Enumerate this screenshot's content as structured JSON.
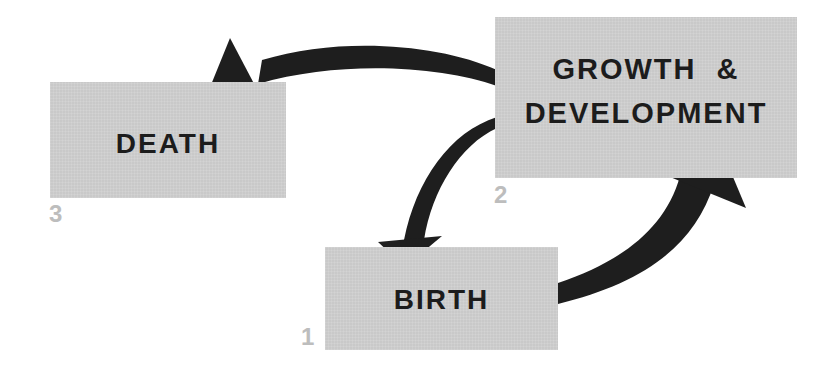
{
  "diagram": {
    "type": "life-cycle",
    "nodes": [
      {
        "id": "death",
        "label": "DEATH",
        "number": "3"
      },
      {
        "id": "growth",
        "label_line1": "GROWTH  &",
        "label_line2": "DEVELOPMENT",
        "number": "2"
      },
      {
        "id": "birth",
        "label": "BIRTH",
        "number": "1"
      }
    ],
    "edges": [
      {
        "from": "birth",
        "to": "growth"
      },
      {
        "from": "growth",
        "to": "death"
      },
      {
        "from": "growth",
        "to": "birth"
      }
    ],
    "colors": {
      "box_fill": "#c9c9c9",
      "text": "#1c1c1c",
      "arrow": "#1e1e1e",
      "number": "#bdbdbd",
      "background": "#ffffff"
    }
  }
}
